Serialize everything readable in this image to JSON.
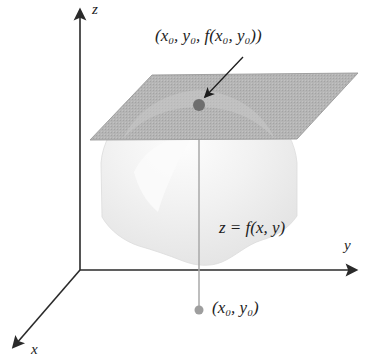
{
  "figure": {
    "background_color": "#ffffff",
    "width": 371,
    "height": 356
  },
  "axes": {
    "z_label": "z",
    "y_label": "y",
    "x_label": "x",
    "origin": {
      "x": 80,
      "y": 270
    },
    "color": "#2a2a2a"
  },
  "labels": {
    "tangent_point": "(x₀, y₀, f(x₀, y₀))",
    "surface_equation": "z = f(x, y)",
    "base_point": "(x₀, y₀)"
  },
  "surface": {
    "name": "dome-surface",
    "fill_color": "#ededed",
    "edge_color": "#dcdcdc",
    "description": "light gray dome shaped surface with wavy lower edge"
  },
  "tangent_plane": {
    "name": "tangent-plane",
    "fill_color": "#b5b5b5",
    "edge_color": "#9a9a9a",
    "corners": [
      {
        "x": 90,
        "y": 140
      },
      {
        "x": 152,
        "y": 75
      },
      {
        "x": 358,
        "y": 73
      },
      {
        "x": 297,
        "y": 139
      }
    ]
  },
  "points": {
    "tangent_point_marker": {
      "x": 199,
      "y": 105,
      "radius": 6,
      "color": "#6e6e6e"
    },
    "base_point_marker": {
      "x": 199,
      "y": 310,
      "radius": 4.5,
      "color": "#9e9e9e"
    }
  },
  "drop_line": {
    "name": "vertical-drop-line",
    "from": {
      "x": 199,
      "y": 105
    },
    "to": {
      "x": 199,
      "y": 310
    },
    "color": "#a8a8a8"
  },
  "annotation_arrow": {
    "name": "pointer-arrow",
    "from": {
      "x": 243,
      "y": 57
    },
    "to": {
      "x": 204,
      "y": 98
    },
    "color": "#1d1d1d"
  }
}
